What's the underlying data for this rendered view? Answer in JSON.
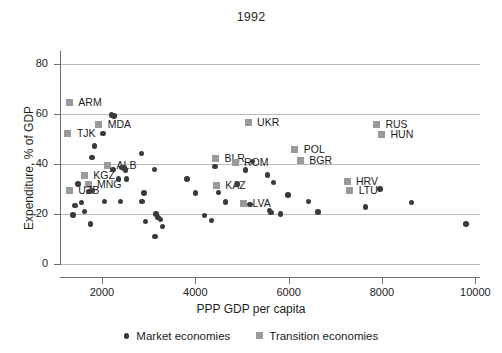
{
  "chart_data": {
    "type": "scatter",
    "title": "1992",
    "xlabel": "PPP GDP per capita",
    "ylabel": "Expenditure, % of GDP",
    "xlim": [
      1100,
      10100
    ],
    "ylim": [
      0,
      85
    ],
    "xticks": [
      2000,
      4000,
      6000,
      8000,
      10000
    ],
    "yticks": [
      0,
      20,
      40,
      60,
      80
    ],
    "grid": true,
    "legend_position": "bottom",
    "colors": {
      "market": "#3b3b3b",
      "transition": "#9a9a9a"
    },
    "legend": [
      {
        "label": "Market economies",
        "marker": "circle"
      },
      {
        "label": "Transition economies",
        "marker": "square"
      }
    ],
    "series": [
      {
        "name": "Transition economies",
        "marker": "square",
        "points": [
          {
            "label": "ARM",
            "x": 1300,
            "y": 64.5,
            "label_dx": 9,
            "label_dy": 0
          },
          {
            "label": "TJK",
            "x": 1270,
            "y": 52.0,
            "label_dx": 9,
            "label_dy": 0
          },
          {
            "label": "MDA",
            "x": 1930,
            "y": 55.5,
            "label_dx": 9,
            "label_dy": 0
          },
          {
            "label": "ALB",
            "x": 2120,
            "y": 39.5,
            "label_dx": 9,
            "label_dy": 0
          },
          {
            "label": "KGZ",
            "x": 1620,
            "y": 35.5,
            "label_dx": 9,
            "label_dy": 0
          },
          {
            "label": "MNG",
            "x": 1700,
            "y": 31.8,
            "label_dx": 9,
            "label_dy": 0
          },
          {
            "label": "UZB",
            "x": 1300,
            "y": 29.5,
            "label_dx": 9,
            "label_dy": 0
          },
          {
            "label": "BLR",
            "x": 4430,
            "y": 42.0,
            "label_dx": 9,
            "label_dy": 0
          },
          {
            "label": "ROM",
            "x": 4850,
            "y": 40.5,
            "label_dx": 9,
            "label_dy": 0
          },
          {
            "label": "UKR",
            "x": 5130,
            "y": 56.5,
            "label_dx": 9,
            "label_dy": 0
          },
          {
            "label": "POL",
            "x": 6130,
            "y": 45.5,
            "label_dx": 9,
            "label_dy": 0
          },
          {
            "label": "BGR",
            "x": 6250,
            "y": 41.5,
            "label_dx": 9,
            "label_dy": 0
          },
          {
            "label": "KAZ",
            "x": 4450,
            "y": 31.5,
            "label_dx": 9,
            "label_dy": 0
          },
          {
            "label": "LVA",
            "x": 5030,
            "y": 24.0,
            "label_dx": 9,
            "label_dy": 0
          },
          {
            "label": "RUS",
            "x": 7880,
            "y": 55.5,
            "label_dx": 9,
            "label_dy": 0
          },
          {
            "label": "HUN",
            "x": 7990,
            "y": 51.5,
            "label_dx": 9,
            "label_dy": 0
          },
          {
            "label": "HRV",
            "x": 7250,
            "y": 33.0,
            "label_dx": 9,
            "label_dy": 0
          },
          {
            "label": "LTU",
            "x": 7310,
            "y": 29.5,
            "label_dx": 9,
            "label_dy": 0
          }
        ]
      },
      {
        "name": "Market economies",
        "marker": "circle",
        "points": [
          {
            "x": 2200,
            "y": 59.5
          },
          {
            "x": 2260,
            "y": 59.0
          },
          {
            "x": 2020,
            "y": 52.0
          },
          {
            "x": 1840,
            "y": 47.0
          },
          {
            "x": 1790,
            "y": 42.5
          },
          {
            "x": 2850,
            "y": 44.0
          },
          {
            "x": 4420,
            "y": 39.0
          },
          {
            "x": 5230,
            "y": 41.0
          },
          {
            "x": 2420,
            "y": 38.5
          },
          {
            "x": 2470,
            "y": 38.3
          },
          {
            "x": 2500,
            "y": 37.5
          },
          {
            "x": 2240,
            "y": 37.8
          },
          {
            "x": 3130,
            "y": 37.8
          },
          {
            "x": 5080,
            "y": 37.5
          },
          {
            "x": 5550,
            "y": 35.5
          },
          {
            "x": 2350,
            "y": 34.0
          },
          {
            "x": 2520,
            "y": 34.0
          },
          {
            "x": 3820,
            "y": 34.0
          },
          {
            "x": 4900,
            "y": 32.0
          },
          {
            "x": 5670,
            "y": 32.5
          },
          {
            "x": 1490,
            "y": 32.0
          },
          {
            "x": 1720,
            "y": 29.0
          },
          {
            "x": 1800,
            "y": 29.3
          },
          {
            "x": 2900,
            "y": 28.3
          },
          {
            "x": 4000,
            "y": 28.3
          },
          {
            "x": 4500,
            "y": 28.5
          },
          {
            "x": 5990,
            "y": 27.5
          },
          {
            "x": 6420,
            "y": 25.0
          },
          {
            "x": 7960,
            "y": 30.0
          },
          {
            "x": 8630,
            "y": 24.5
          },
          {
            "x": 7650,
            "y": 22.8
          },
          {
            "x": 1560,
            "y": 24.5
          },
          {
            "x": 1420,
            "y": 23.3
          },
          {
            "x": 2050,
            "y": 25.0
          },
          {
            "x": 2400,
            "y": 25.0
          },
          {
            "x": 2860,
            "y": 25.0
          },
          {
            "x": 4650,
            "y": 24.8
          },
          {
            "x": 5170,
            "y": 23.8
          },
          {
            "x": 1620,
            "y": 21.0
          },
          {
            "x": 3160,
            "y": 20.0
          },
          {
            "x": 3200,
            "y": 18.5
          },
          {
            "x": 3250,
            "y": 17.8
          },
          {
            "x": 4200,
            "y": 19.3
          },
          {
            "x": 5590,
            "y": 21.3
          },
          {
            "x": 5620,
            "y": 20.5
          },
          {
            "x": 5830,
            "y": 20.0
          },
          {
            "x": 6630,
            "y": 20.8
          },
          {
            "x": 1380,
            "y": 19.5
          },
          {
            "x": 2930,
            "y": 17.0
          },
          {
            "x": 4350,
            "y": 17.3
          },
          {
            "x": 1750,
            "y": 16.0
          },
          {
            "x": 3300,
            "y": 15.0
          },
          {
            "x": 3140,
            "y": 11.0
          },
          {
            "x": 9800,
            "y": 16.0
          }
        ]
      }
    ]
  }
}
